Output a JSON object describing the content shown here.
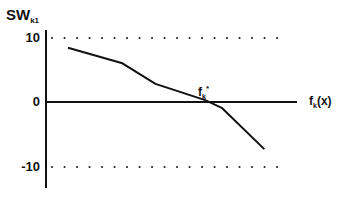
{
  "chart_data": {
    "type": "line",
    "title": "",
    "ylabel": "SW_k1",
    "ylabel_main": "SW",
    "ylabel_sub": "k1",
    "xlabel": "f_k(x)",
    "xlabel_main": "f",
    "xlabel_sub": "k",
    "xlabel_suffix": "(x)",
    "ylim": [
      -13,
      11
    ],
    "yticks": [
      10,
      0,
      -10
    ],
    "ytick_labels": [
      "10",
      "0",
      "-10"
    ],
    "reference_lines": [
      {
        "y": 10,
        "style": "dotted"
      },
      {
        "y": -10,
        "style": "dotted"
      }
    ],
    "grid": false,
    "series": [
      {
        "name": "SW_k1",
        "x": [
          0.0,
          0.23,
          0.37,
          0.58,
          0.65,
          0.83
        ],
        "values": [
          8.4,
          6.0,
          2.8,
          0.3,
          -0.9,
          -7.3
        ]
      }
    ],
    "annotations": [
      {
        "text": "f_k*",
        "main": "f",
        "sub": "k",
        "sup": "*",
        "x": 0.6,
        "y": 0,
        "note": "zero crossing"
      }
    ],
    "colors": {
      "line": "#111111",
      "axis": "#111111",
      "dots": "#222222"
    }
  }
}
